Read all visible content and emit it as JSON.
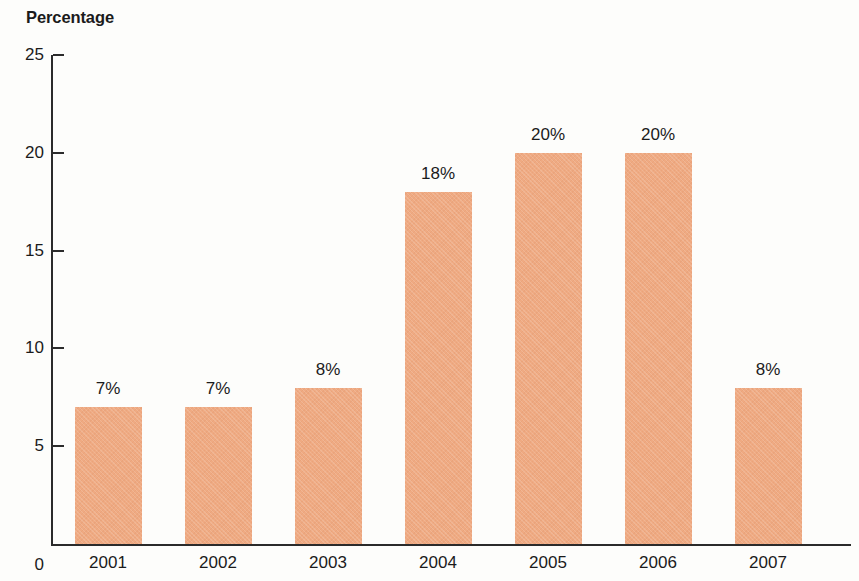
{
  "chart_data": {
    "type": "bar",
    "title": "Percentage",
    "xlabel": "",
    "ylabel": "Percentage",
    "categories": [
      "2001",
      "2002",
      "2003",
      "2004",
      "2005",
      "2006",
      "2007"
    ],
    "values": [
      7,
      7,
      8,
      18,
      20,
      20,
      8
    ],
    "value_labels": [
      "7%",
      "7%",
      "8%",
      "18%",
      "20%",
      "20%",
      "8%"
    ],
    "ylim": [
      0,
      25
    ],
    "y_ticks": [
      "0",
      "5",
      "10",
      "15",
      "20",
      "25"
    ],
    "y_tick_values": [
      0,
      5,
      10,
      15,
      20,
      25
    ],
    "grid": false,
    "legend": "none",
    "bar_color": "#efaa82",
    "axis_color": "#2b2b2b",
    "text_color": "#1b1b1b",
    "background_color": "#fdfdfb"
  }
}
